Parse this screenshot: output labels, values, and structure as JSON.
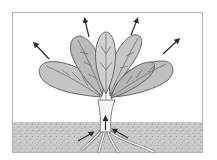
{
  "diagram": {
    "colors": {
      "frame": "#b8b8b8",
      "sky": "#ffffff",
      "soil": "#c9c9c9",
      "soil_speckle": "#9a9a9a",
      "leaf_fill": "#bdbdbd",
      "leaf_light": "#d6d6d6",
      "leaf_outline": "#5a5a5a",
      "vein": "#555555",
      "stem": "#f4f4f4",
      "stem_outline": "#777777",
      "arrow": "#2b2b2b"
    },
    "arrows": {
      "out_of_leaves": 6,
      "into_roots_and_stem": 3
    }
  }
}
